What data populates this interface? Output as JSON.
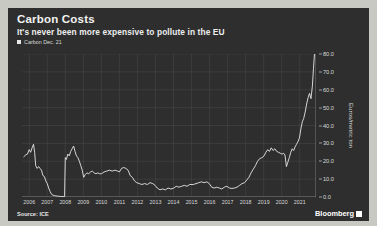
{
  "header": {
    "title": "Carbon Costs",
    "subtitle": "It's never been more expensive to pollute in the EU"
  },
  "legend": {
    "entries": [
      {
        "label": "Carbon Dec. 21",
        "color": "#e8e8e8"
      }
    ]
  },
  "footer": {
    "source": "Source: ICE",
    "brand": "Bloomberg",
    "brand_mark": "▪"
  },
  "chart_data": {
    "type": "line",
    "title": "Carbon Costs",
    "subtitle": "It's never been more expensive to pollute in the EU",
    "xlabel": "",
    "ylabel": "Euros/metric ton",
    "ylim": [
      0,
      80
    ],
    "xlim": [
      2005.6,
      2021.9
    ],
    "grid": true,
    "legend_position": "top-left",
    "source": "Source: ICE",
    "yticks": [
      "0.0",
      "10.0",
      "20.0",
      "30.0",
      "40.0",
      "50.0",
      "60.0",
      "70.0",
      "80.0"
    ],
    "ytick_values": [
      0,
      10,
      20,
      30,
      40,
      50,
      60,
      70,
      80
    ],
    "xticks": [
      "2006",
      "2007",
      "2008",
      "2009",
      "2010",
      "2011",
      "2012",
      "2013",
      "2014",
      "2015",
      "2016",
      "2017",
      "2018",
      "2019",
      "2020",
      "2021"
    ],
    "xtick_values": [
      2006,
      2007,
      2008,
      2009,
      2010,
      2011,
      2012,
      2013,
      2014,
      2015,
      2016,
      2017,
      2018,
      2019,
      2020,
      2021
    ],
    "series": [
      {
        "name": "Carbon Dec. 21",
        "color": "#e8e8e8",
        "x": [
          2005.7,
          2005.8,
          2005.9,
          2006.0,
          2006.08,
          2006.16,
          2006.24,
          2006.3,
          2006.36,
          2006.44,
          2006.52,
          2006.6,
          2006.68,
          2006.76,
          2006.84,
          2006.92,
          2007.0,
          2007.08,
          2007.16,
          2007.24,
          2007.32,
          2007.4,
          2007.48,
          2007.56,
          2007.64,
          2007.72,
          2007.8,
          2007.88,
          2007.96,
          2008.0,
          2008.06,
          2008.14,
          2008.22,
          2008.3,
          2008.38,
          2008.46,
          2008.54,
          2008.62,
          2008.7,
          2008.78,
          2008.86,
          2008.94,
          2009.02,
          2009.1,
          2009.2,
          2009.3,
          2009.4,
          2009.5,
          2009.6,
          2009.7,
          2009.8,
          2009.9,
          2010.0,
          2010.15,
          2010.3,
          2010.45,
          2010.6,
          2010.75,
          2010.9,
          2011.0,
          2011.12,
          2011.24,
          2011.36,
          2011.48,
          2011.6,
          2011.72,
          2011.84,
          2011.96,
          2012.1,
          2012.25,
          2012.4,
          2012.55,
          2012.7,
          2012.85,
          2012.98,
          2013.1,
          2013.25,
          2013.4,
          2013.55,
          2013.7,
          2013.85,
          2013.98,
          2014.15,
          2014.3,
          2014.45,
          2014.6,
          2014.75,
          2014.9,
          2015.1,
          2015.25,
          2015.4,
          2015.55,
          2015.7,
          2015.85,
          2015.98,
          2016.12,
          2016.26,
          2016.4,
          2016.54,
          2016.68,
          2016.82,
          2016.96,
          2017.1,
          2017.24,
          2017.38,
          2017.52,
          2017.66,
          2017.8,
          2017.94,
          2018.06,
          2018.18,
          2018.3,
          2018.42,
          2018.54,
          2018.66,
          2018.78,
          2018.9,
          2019.02,
          2019.12,
          2019.22,
          2019.32,
          2019.42,
          2019.52,
          2019.62,
          2019.72,
          2019.82,
          2019.92,
          2020.02,
          2020.1,
          2020.18,
          2020.26,
          2020.34,
          2020.42,
          2020.5,
          2020.58,
          2020.66,
          2020.74,
          2020.82,
          2020.9,
          2020.98,
          2021.06,
          2021.14,
          2021.22,
          2021.3,
          2021.38,
          2021.46,
          2021.54,
          2021.62,
          2021.7,
          2021.76,
          2021.82
        ],
        "y": [
          22.5,
          23.5,
          24.0,
          26.5,
          25.0,
          27.5,
          29.5,
          25.0,
          17.5,
          16.0,
          17.0,
          16.0,
          15.0,
          12.0,
          11.5,
          9.0,
          7.5,
          5.0,
          3.0,
          1.5,
          1.0,
          0.8,
          0.6,
          0.5,
          0.4,
          0.3,
          0.3,
          0.25,
          0.2,
          22.0,
          21.0,
          24.0,
          23.0,
          25.5,
          27.0,
          28.5,
          25.5,
          23.0,
          22.0,
          20.0,
          17.5,
          15.0,
          11.0,
          12.5,
          13.5,
          13.0,
          14.0,
          14.5,
          13.5,
          13.0,
          13.5,
          13.0,
          13.0,
          14.0,
          14.5,
          15.0,
          14.5,
          15.0,
          14.5,
          14.0,
          16.0,
          16.5,
          16.0,
          15.0,
          12.0,
          11.0,
          9.0,
          8.0,
          7.5,
          7.0,
          7.5,
          7.0,
          8.0,
          7.5,
          6.5,
          5.0,
          4.0,
          4.5,
          4.0,
          5.0,
          4.5,
          4.8,
          6.0,
          5.5,
          6.0,
          6.5,
          6.0,
          7.0,
          7.0,
          7.5,
          8.0,
          8.5,
          8.0,
          8.5,
          7.5,
          5.5,
          5.0,
          5.5,
          5.0,
          4.5,
          5.5,
          6.0,
          5.0,
          4.8,
          5.0,
          5.5,
          6.5,
          7.5,
          8.0,
          9.5,
          11.0,
          13.5,
          15.5,
          17.5,
          20.0,
          21.5,
          22.0,
          23.0,
          25.0,
          26.5,
          25.5,
          27.5,
          26.0,
          27.0,
          25.5,
          25.0,
          24.5,
          24.0,
          24.5,
          23.5,
          17.0,
          19.5,
          22.0,
          25.0,
          27.0,
          26.0,
          28.0,
          29.5,
          31.0,
          33.0,
          38.0,
          42.0,
          44.0,
          47.5,
          52.0,
          55.5,
          58.0,
          55.0,
          62.0,
          72.0,
          80.5
        ]
      }
    ]
  }
}
